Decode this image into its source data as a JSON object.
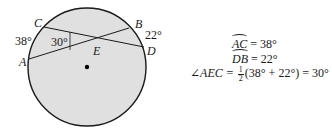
{
  "figure": {
    "circle": {
      "cx": 87,
      "cy": 67,
      "r": 59,
      "fill": "#e0e0e0",
      "stroke": "#1a1a1a"
    },
    "center_dot": {
      "cx": 87,
      "cy": 67,
      "r": 2.2
    },
    "points": {
      "A": {
        "x": 29,
        "y": 59,
        "label": "A"
      },
      "B": {
        "x": 129,
        "y": 28,
        "label": "B"
      },
      "C": {
        "x": 44,
        "y": 27,
        "label": "C"
      },
      "D": {
        "x": 144,
        "y": 47,
        "label": "D"
      },
      "E": {
        "x": 97,
        "y": 42,
        "label": "E"
      }
    },
    "chords": [
      {
        "from": "A",
        "to": "B"
      },
      {
        "from": "C",
        "to": "D"
      }
    ],
    "arc_labels": {
      "AC": "38°",
      "DB": "22°"
    },
    "angle_label": "30°"
  },
  "equations": {
    "line1": {
      "arc": "AC",
      "rhs": " = 38°"
    },
    "line2": {
      "arc": "DB",
      "rhs": " = 22°"
    },
    "line3": {
      "lhs": "∠AEC = ",
      "frac_num": "1",
      "frac_den": "2",
      "rhs": "(38° + 22°) = 30°"
    }
  }
}
